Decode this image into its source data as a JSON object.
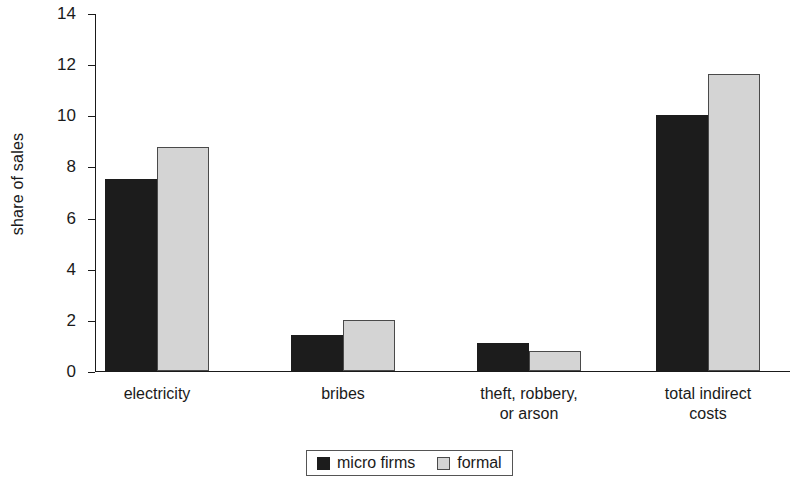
{
  "chart_data": {
    "type": "bar",
    "title": "",
    "xlabel": "",
    "ylabel": "share of sales",
    "ylim": [
      0,
      14
    ],
    "yticks": [
      0,
      2,
      4,
      6,
      8,
      10,
      12,
      14
    ],
    "grid": false,
    "legend_position": "bottom-center",
    "categories": [
      "electricity",
      "bribes",
      "theft, robbery,\nor arson",
      "total indirect\ncosts"
    ],
    "series": [
      {
        "name": "micro firms",
        "color": "#1c1c1c",
        "values": [
          7.5,
          1.4,
          1.1,
          10.0
        ]
      },
      {
        "name": "formal",
        "color": "#d4d4d4",
        "values": [
          8.75,
          2.0,
          0.8,
          11.6
        ]
      }
    ]
  },
  "legend": {
    "items": [
      {
        "label": "micro firms",
        "swatch": "black-square-swatch"
      },
      {
        "label": "formal",
        "swatch": "gray-square-swatch"
      }
    ]
  }
}
